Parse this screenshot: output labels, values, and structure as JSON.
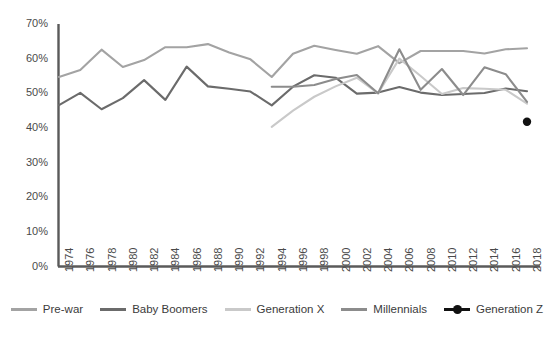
{
  "chart_data": {
    "type": "line",
    "title": "",
    "subtitle": "",
    "xlabel": "",
    "ylabel": "",
    "xlim": [
      1974,
      2018
    ],
    "ylim": [
      0,
      70
    ],
    "grid": false,
    "legend_position": "bottom",
    "y_ticks": [
      "0%",
      "10%",
      "20%",
      "30%",
      "40%",
      "50%",
      "60%",
      "70%"
    ],
    "y_tick_values": [
      0,
      10,
      20,
      30,
      40,
      50,
      60,
      70
    ],
    "x_ticks": [
      "1974",
      "1976",
      "1978",
      "1980",
      "1982",
      "1984",
      "1986",
      "1988",
      "1990",
      "1992",
      "1994",
      "1996",
      "1998",
      "2000",
      "2002",
      "2004",
      "2006",
      "2008",
      "2010",
      "2012",
      "2014",
      "2016",
      "2018"
    ],
    "x_tick_values": [
      1974,
      1976,
      1978,
      1980,
      1982,
      1984,
      1986,
      1988,
      1990,
      1992,
      1994,
      1996,
      1998,
      2000,
      2002,
      2004,
      2006,
      2008,
      2010,
      2012,
      2014,
      2016,
      2018
    ],
    "series": [
      {
        "name": "Pre-war",
        "color": "#a3a3a3",
        "marker": "none",
        "x": [
          1974,
          1976,
          1978,
          1980,
          1982,
          1984,
          1986,
          1988,
          1990,
          1992,
          1994,
          1996,
          1998,
          2000,
          2002,
          2004,
          2006,
          2008,
          2010,
          2012,
          2014,
          2016,
          2018
        ],
        "values": [
          54.7,
          56.7,
          62.6,
          57.6,
          59.6,
          63.3,
          63.3,
          64.2,
          61.8,
          59.8,
          54.7,
          61.4,
          63.7,
          62.5,
          61.4,
          63.6,
          58.7,
          62.2,
          62.2,
          62.2,
          61.5,
          62.7,
          63.0
        ]
      },
      {
        "name": "Baby Boomers",
        "color": "#6b6b6b",
        "marker": "none",
        "x": [
          1974,
          1976,
          1978,
          1980,
          1982,
          1984,
          1986,
          1988,
          1990,
          1992,
          1994,
          1996,
          1998,
          2000,
          2002,
          2004,
          2006,
          2008,
          2010,
          2012,
          2014,
          2016,
          2018
        ],
        "values": [
          46.6,
          50.1,
          45.4,
          48.6,
          53.8,
          48.1,
          57.7,
          52.0,
          51.3,
          50.5,
          46.5,
          51.9,
          55.2,
          54.5,
          49.9,
          50.2,
          51.8,
          50.2,
          49.5,
          49.8,
          50.1,
          51.4,
          50.6
        ]
      },
      {
        "name": "Generation X",
        "color": "#c9c9c9",
        "marker": "none",
        "x": [
          1994,
          1996,
          1998,
          2000,
          2002,
          2004,
          2006,
          2008,
          2010,
          2012,
          2014,
          2016,
          2018
        ],
        "values": [
          40.3,
          45.0,
          49.0,
          52.0,
          54.5,
          50.0,
          60.0,
          55.0,
          49.8,
          51.5,
          51.3,
          51.0,
          47.0
        ]
      },
      {
        "name": "Millennials",
        "color": "#8c8c8c",
        "marker": "none",
        "x": [
          1994,
          1996,
          1998,
          2000,
          2002,
          2004,
          2006,
          2008,
          2010,
          2012,
          2014,
          2016,
          2018
        ],
        "values": [
          51.9,
          51.9,
          52.4,
          54.1,
          55.3,
          50.0,
          62.7,
          51.0,
          57.0,
          49.5,
          57.5,
          55.5,
          47.5
        ]
      },
      {
        "name": "Generation Z",
        "color": "#111111",
        "marker": "circle",
        "x": [
          2018
        ],
        "values": [
          41.8
        ]
      }
    ]
  },
  "legend": {
    "items": [
      {
        "label": "Pre-war",
        "color": "#a3a3a3",
        "marker": "line"
      },
      {
        "label": "Baby Boomers",
        "color": "#6b6b6b",
        "marker": "line"
      },
      {
        "label": "Generation X",
        "color": "#c9c9c9",
        "marker": "line"
      },
      {
        "label": "Millennials",
        "color": "#8c8c8c",
        "marker": "line"
      },
      {
        "label": "Generation Z",
        "color": "#111111",
        "marker": "line-dot"
      }
    ]
  }
}
